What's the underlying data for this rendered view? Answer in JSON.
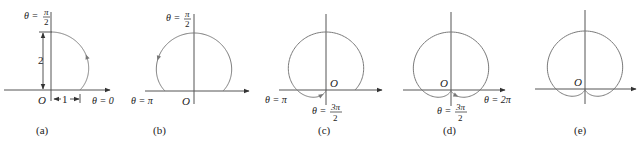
{
  "figure": {
    "curve": "r = 1 + sin θ",
    "curve_color": "#7a7a7a",
    "axis_color": "#555555",
    "panels": [
      {
        "id": "a",
        "caption": "(a)",
        "origin": [
          51,
          90
        ],
        "scale": 29,
        "theta_start": 0,
        "theta_end": 1.5708,
        "arrow_theta": 0.75,
        "labels": {
          "top": "θ = π/2",
          "origin": "O",
          "right": "θ = 0",
          "height_dim": "2",
          "width_dim": "1"
        }
      },
      {
        "id": "b",
        "caption": "(b)",
        "origin": [
          194,
          91
        ],
        "scale": 29,
        "theta_start": 0,
        "theta_end": 3.1416,
        "arrow_theta": 2.4,
        "labels": {
          "top": "θ = π/2",
          "origin": "O",
          "left": "θ = π"
        }
      },
      {
        "id": "c",
        "caption": "(c)",
        "origin": [
          326,
          90
        ],
        "scale": 29,
        "theta_start": 0,
        "theta_end": 4.7124,
        "arrow_theta": 4.0,
        "labels": {
          "origin": "O",
          "left": "θ = π",
          "bottom": "θ = 3π/2"
        }
      },
      {
        "id": "d",
        "caption": "(d)",
        "origin": [
          451,
          90
        ],
        "scale": 29,
        "theta_start": 0,
        "theta_end": 6.2832,
        "arrow_theta": 5.45,
        "labels": {
          "origin": "O",
          "right": "θ = 2π",
          "bottom": "θ = 3π/2"
        }
      },
      {
        "id": "e",
        "caption": "(e)",
        "origin": [
          585,
          89
        ],
        "scale": 29,
        "theta_start": 0,
        "theta_end": 6.2832,
        "arrow_theta": null,
        "labels": {
          "origin": "O"
        }
      }
    ]
  }
}
